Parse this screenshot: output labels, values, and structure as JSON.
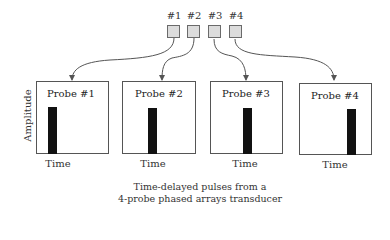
{
  "transducer": {
    "elements": [
      {
        "label": "#1",
        "x": 167
      },
      {
        "label": "#2",
        "x": 187
      },
      {
        "label": "#3",
        "x": 208
      },
      {
        "label": "#4",
        "x": 229
      }
    ]
  },
  "axis": {
    "y_label": "Amplitude",
    "x_label": "Time"
  },
  "probes": [
    {
      "title": "Probe #1",
      "time_label": "Time"
    },
    {
      "title": "Probe #2",
      "time_label": "Time"
    },
    {
      "title": "Probe #3",
      "time_label": "Time"
    },
    {
      "title": "Probe #4",
      "time_label": "Time"
    }
  ],
  "caption": {
    "line1": "Time-delayed pulses from a",
    "line2": "4-probe phased arrays transducer"
  },
  "colors": {
    "element_fill": "#dcdcdc",
    "element_border": "#6a6a6a",
    "pulse": "#111111",
    "arrow": "#555555"
  }
}
